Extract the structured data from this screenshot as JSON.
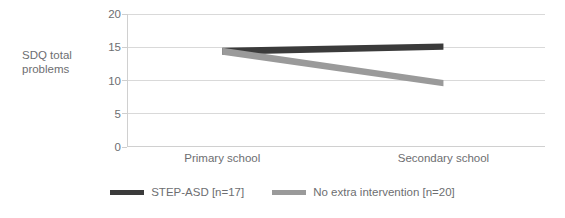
{
  "chart_data": {
    "type": "line",
    "title": "",
    "xlabel": "",
    "ylabel": "SDQ total\nproblems",
    "categories": [
      "Primary school",
      "Secondary school"
    ],
    "x": [
      0,
      1
    ],
    "ylim": [
      0,
      20
    ],
    "yticks": [
      0,
      5,
      10,
      15,
      20
    ],
    "ytick_labels": [
      "0",
      "5",
      "10",
      "15",
      "20"
    ],
    "grid": true,
    "legend_position": "bottom",
    "series": [
      {
        "name": "STEP-ASD [n=17]",
        "values": [
          14.4,
          15.1
        ],
        "color": "#3b3b3b"
      },
      {
        "name": "No extra intervention [n=20]",
        "values": [
          14.4,
          9.6
        ],
        "color": "#9a9a9a"
      }
    ]
  },
  "legend": {
    "items": [
      {
        "label": "STEP-ASD [n=17]",
        "color": "#3b3b3b",
        "swatch": "line-swatch"
      },
      {
        "label": "No extra intervention [n=20]",
        "color": "#9a9a9a",
        "swatch": "line-swatch"
      }
    ]
  }
}
